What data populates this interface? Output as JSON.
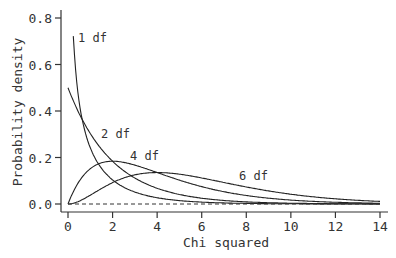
{
  "chart_data": {
    "type": "line",
    "title": "",
    "xlabel": "Chi squared",
    "ylabel": "Probability density",
    "xlim": [
      0,
      14
    ],
    "ylim": [
      0,
      0.8
    ],
    "x_ticks": [
      "0",
      "2",
      "4",
      "6",
      "8",
      "10",
      "12",
      "14"
    ],
    "y_ticks": [
      "0.0",
      "0.2",
      "0.4",
      "0.6",
      "0.8"
    ],
    "grid": false,
    "legend": "inline labels",
    "series": [
      {
        "name": "1 df",
        "df": 1,
        "label": "1 df"
      },
      {
        "name": "2 df",
        "df": 2,
        "label": "2 df"
      },
      {
        "name": "4 df",
        "df": 4,
        "label": "4 df"
      },
      {
        "name": "6 df",
        "df": 6,
        "label": "6 df"
      }
    ],
    "reference_line": {
      "y": 0,
      "style": "dashed"
    }
  }
}
